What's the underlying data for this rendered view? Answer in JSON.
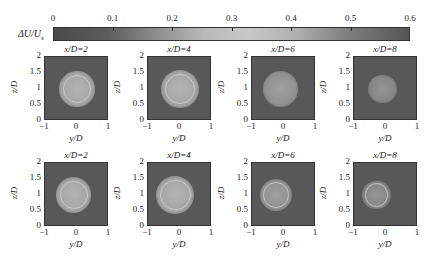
{
  "chart_data": {
    "type": "heatmap",
    "title": "",
    "colorbar": {
      "label": "ΔU/U_s",
      "label_display": "ΔU/U",
      "label_sub": "s",
      "ticks": [
        "0",
        "0.1",
        "0.2",
        "0.3",
        "0.4",
        "0.5",
        "0.6"
      ],
      "range": [
        0,
        0.6
      ]
    },
    "xlabel": "y/D",
    "ylabel": "z/D",
    "xticks": [
      "−1",
      "0",
      "1"
    ],
    "yticks": [
      "2",
      "1.5",
      "1",
      "0.5",
      "0"
    ],
    "xlim": [
      -1,
      1
    ],
    "ylim": [
      0,
      2
    ],
    "rows": [
      {
        "panels": [
          {
            "title": "x/D=2",
            "wake_center": [
              0.0,
              1.0
            ],
            "wake_radius": 0.55,
            "peak": 0.4,
            "ring": true
          },
          {
            "title": "x/D=4",
            "wake_center": [
              0.0,
              1.0
            ],
            "wake_radius": 0.6,
            "peak": 0.4,
            "ring": true
          },
          {
            "title": "x/D=6",
            "wake_center": [
              -0.1,
              1.0
            ],
            "wake_radius": 0.55,
            "peak": 0.3,
            "ring": false
          },
          {
            "title": "x/D=8",
            "wake_center": [
              -0.1,
              1.0
            ],
            "wake_radius": 0.45,
            "peak": 0.25,
            "ring": false
          }
        ]
      },
      {
        "panels": [
          {
            "title": "x/D=2",
            "wake_center": [
              -0.1,
              1.0
            ],
            "wake_radius": 0.55,
            "peak": 0.4,
            "ring": true
          },
          {
            "title": "x/D=4",
            "wake_center": [
              -0.15,
              1.0
            ],
            "wake_radius": 0.6,
            "peak": 0.4,
            "ring": true
          },
          {
            "title": "x/D=6",
            "wake_center": [
              -0.25,
              1.0
            ],
            "wake_radius": 0.5,
            "peak": 0.3,
            "ring": true
          },
          {
            "title": "x/D=8",
            "wake_center": [
              -0.3,
              1.0
            ],
            "wake_radius": 0.45,
            "peak": 0.25,
            "ring": true
          }
        ]
      }
    ]
  }
}
